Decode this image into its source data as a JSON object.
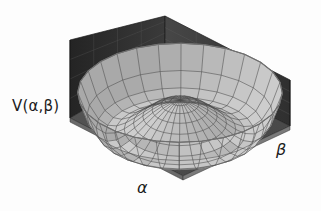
{
  "figure": {
    "title": "",
    "background_color": "#fdfdfd",
    "width": 321,
    "height": 211
  },
  "labels": {
    "vertical_axis": "V(α,β)",
    "alpha_axis": "α",
    "beta_axis": "β"
  },
  "colors": {
    "background": "#fdfdfd",
    "floor": "#4e4e4e",
    "floor_grid": "#3a3a3a",
    "wall_left": "#2e2e2e",
    "wall_right": "#3c3c3c",
    "wall_grid": "#565656",
    "surface_light": "#e8e8e8",
    "surface_mid": "#cdcdcd",
    "surface_dark": "#9a9a9a",
    "mesh_line": "#4a4a4a",
    "rim_edge": "#707070",
    "text": "#1b1b1b"
  },
  "chart_data": {
    "type": "surface",
    "title": "",
    "xlabel": "α",
    "ylabel": "β",
    "zlabel": "V(α,β)",
    "function": "V(a,b) = -mu2*(a^2+b^2) + lambda*(a^2+b^2)^2",
    "parameters": {
      "mu2": 1.0,
      "lambda": 0.25,
      "r0": 1.414,
      "central_max_value": 0.0,
      "valley_min_value": -1.0
    },
    "domain": {
      "alpha_range": [
        -2.3,
        2.3
      ],
      "beta_range": [
        -2.3,
        2.3
      ],
      "v_range": [
        -1.0,
        1.4
      ]
    },
    "mesh": {
      "radial_divisions": 11,
      "angular_divisions": 28,
      "grid": true,
      "wireframe_overlay": true
    },
    "projection": {
      "type": "oblique-3d",
      "elevation_deg": 28,
      "azimuth_deg": 38
    },
    "box": {
      "floor_grid_divisions": 4,
      "wall_grid_divisions": 4,
      "walls_shown": [
        "left",
        "right"
      ]
    },
    "legend": null,
    "annotations": []
  }
}
